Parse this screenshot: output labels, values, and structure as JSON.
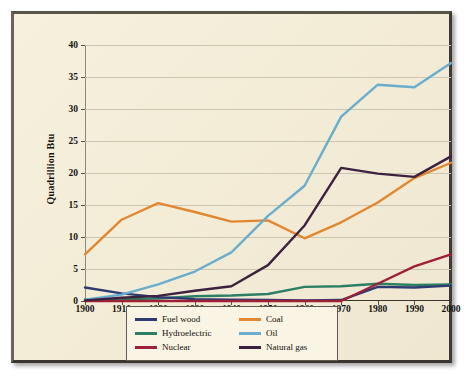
{
  "chart_data": {
    "type": "line",
    "title": "",
    "xlabel": "",
    "ylabel": "Quadrillion Btu",
    "xlim": [
      1900,
      2000
    ],
    "ylim": [
      0,
      40
    ],
    "grid": true,
    "legend_position": "bottom-center",
    "x": [
      1900,
      1910,
      1920,
      1930,
      1940,
      1950,
      1960,
      1970,
      1980,
      1990,
      2000
    ],
    "xticklabels": [
      "1900",
      "1910",
      "1920",
      "1930",
      "1940",
      "1950",
      "1960",
      "1970",
      "1980",
      "1990",
      "2000"
    ],
    "yticks": [
      0,
      5,
      10,
      15,
      20,
      25,
      30,
      35,
      40
    ],
    "yticklabels": [
      "0",
      "5",
      "10",
      "15",
      "20",
      "25",
      "30",
      "35",
      "40"
    ],
    "series": [
      {
        "name": "Fuel wood",
        "color": "#2e3b73",
        "values": [
          2.1,
          1.2,
          0.6,
          0.3,
          0.2,
          0.15,
          0.1,
          0.15,
          2.2,
          2.1,
          2.4
        ]
      },
      {
        "name": "Coal",
        "color": "#e2872f",
        "values": [
          7.3,
          12.7,
          15.3,
          13.9,
          12.4,
          12.6,
          9.8,
          12.3,
          15.4,
          19.2,
          21.6
        ]
      },
      {
        "name": "Hydroelectric",
        "color": "#2c7f63",
        "values": [
          0.25,
          0.3,
          0.4,
          0.75,
          0.85,
          1.1,
          2.2,
          2.3,
          2.7,
          2.5,
          2.6
        ]
      },
      {
        "name": "Oil",
        "color": "#69aece",
        "values": [
          0.2,
          1.0,
          2.6,
          4.6,
          7.6,
          13.3,
          18.0,
          28.8,
          33.8,
          33.4,
          37.2
        ]
      },
      {
        "name": "Nuclear",
        "color": "#9e1f36",
        "values": [
          0,
          0,
          0,
          0,
          0,
          0,
          0,
          0,
          2.7,
          5.4,
          7.3
        ]
      },
      {
        "name": "Natural gas",
        "color": "#3c2240",
        "values": [
          0.1,
          0.5,
          0.8,
          1.6,
          2.3,
          5.6,
          11.8,
          20.8,
          19.9,
          19.4,
          22.6
        ]
      }
    ]
  },
  "legend": {
    "entries": [
      {
        "label": "Fuel wood",
        "color": "#2e3b73"
      },
      {
        "label": "Coal",
        "color": "#e2872f"
      },
      {
        "label": "Hydroelectric",
        "color": "#2c7f63"
      },
      {
        "label": "Oil",
        "color": "#69aece"
      },
      {
        "label": "Nuclear",
        "color": "#9e1f36"
      },
      {
        "label": "Natural gas",
        "color": "#3c2240"
      }
    ]
  },
  "style": {
    "plate_color": "#f3ecd7",
    "frame_color": "#4a443c",
    "grid_color": "#cdc6ae",
    "axis_color": "#3a352f",
    "text_color": "#17130f"
  }
}
